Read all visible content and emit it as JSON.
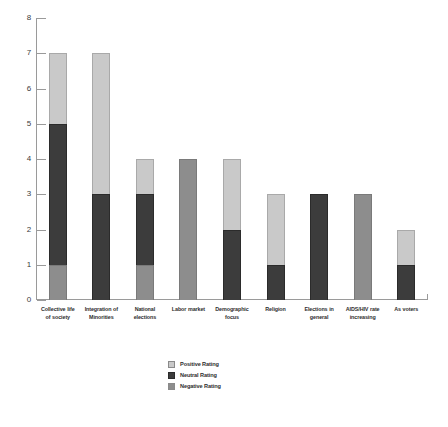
{
  "chart_data": {
    "type": "bar",
    "title": "",
    "subtitle": "",
    "xlabel": "",
    "ylabel": "",
    "stacked": true,
    "grid": false,
    "legend_position": "bottom-center",
    "ylim": [
      0,
      8
    ],
    "yticks": [
      0,
      1,
      2,
      3,
      4,
      5,
      6,
      7,
      8
    ],
    "ytick_labels": [
      "0",
      "1",
      "2",
      "3",
      "4",
      "5",
      "6",
      "7",
      "8"
    ],
    "categories": [
      "Collective life of society",
      "Integration of Minorities",
      "National elections",
      "Labor market",
      "Demographic focus",
      "Religion",
      "Elections in general",
      "AIDS/HIV rate increasing",
      "As voters"
    ],
    "category_lines": [
      [
        "Collective life",
        "of society"
      ],
      [
        "Integration of",
        "Minorities"
      ],
      [
        "National",
        "elections"
      ],
      [
        "Labor market"
      ],
      [
        "Demographic",
        "focus"
      ],
      [
        "Religion"
      ],
      [
        "Elections in",
        "general"
      ],
      [
        "AIDS/HIV rate",
        "increasing"
      ],
      [
        "As voters"
      ]
    ],
    "series": [
      {
        "name": "Negative Rating",
        "color": "#8d8d8d",
        "values": [
          1,
          0,
          1,
          4,
          0,
          0,
          0,
          3,
          0
        ]
      },
      {
        "name": "Neutral Rating",
        "color": "#3c3c3c",
        "values": [
          4,
          3,
          2,
          0,
          2,
          1,
          3,
          0,
          1
        ]
      },
      {
        "name": "Positive Rating",
        "color": "#c9c9c9",
        "values": [
          2,
          4,
          1,
          0,
          2,
          2,
          0,
          0,
          1
        ]
      }
    ],
    "totals": [
      7,
      7,
      4,
      4,
      4,
      3,
      3,
      3,
      2
    ],
    "stack_order_bottom_to_top": [
      "Negative Rating",
      "Neutral Rating",
      "Positive Rating"
    ]
  },
  "legend": {
    "items": [
      {
        "label": "Positive Rating",
        "color": "#c9c9c9"
      },
      {
        "label": "Neutral Rating",
        "color": "#3c3c3c"
      },
      {
        "label": "Negative Rating",
        "color": "#8d8d8d"
      }
    ]
  }
}
